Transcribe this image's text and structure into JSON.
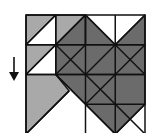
{
  "diagram": {
    "grid": {
      "rows": 4,
      "cols": 4,
      "left": 26,
      "top": 15,
      "cell": 29.75
    },
    "colors": {
      "light": "#a9a9a9",
      "dark": "#6b6b6b",
      "white": "#ffffff",
      "line": "#111111"
    },
    "arrow": {
      "direction": "down",
      "label": ""
    }
  }
}
